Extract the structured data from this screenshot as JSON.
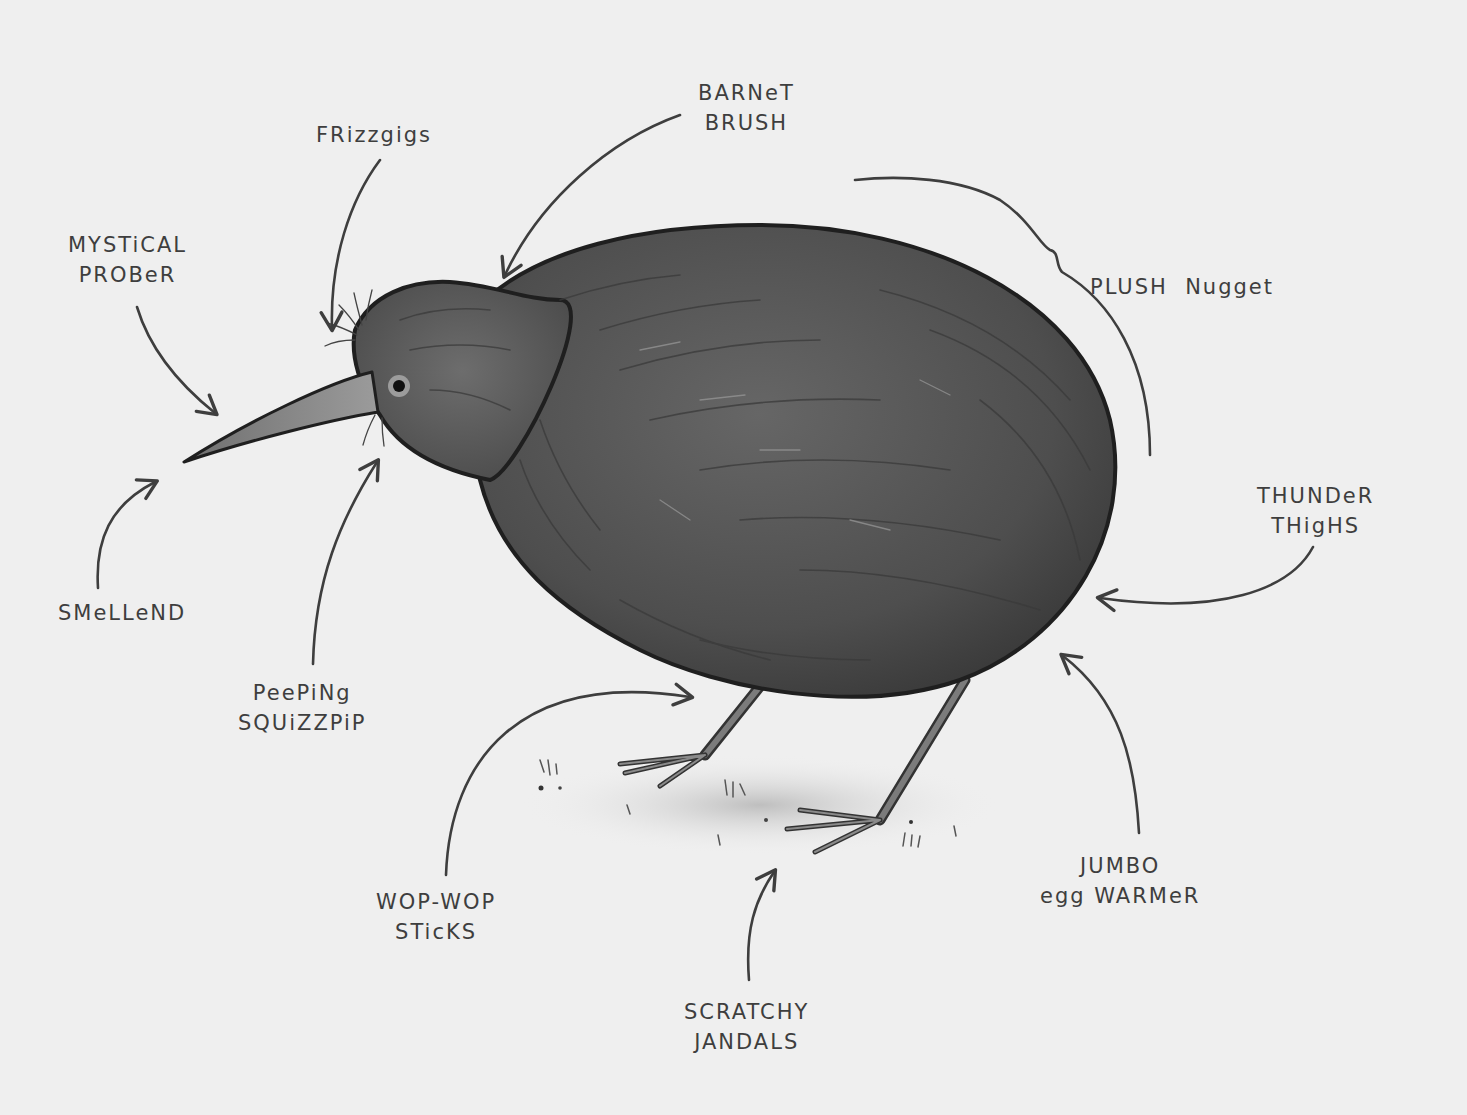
{
  "diagram": {
    "style": "hand-drawn grayscale illustration",
    "colors": {
      "background": "#efefef",
      "ink": "#3e3e3e",
      "body_dark": "#444444",
      "body_mid": "#5c5c5c",
      "beak": "#8a8a8a",
      "legs": "#6e6e6e",
      "ground_shadow": "#c8c8c8"
    },
    "labels": [
      {
        "id": "mystical-prober",
        "lines": [
          "MYSTiCAL",
          "PROBeR"
        ],
        "points_to": "beak tip"
      },
      {
        "id": "frizzgigs",
        "lines": [
          "FRizzgigs"
        ],
        "points_to": "whiskers above beak"
      },
      {
        "id": "barnet-brush",
        "lines": [
          "BARNeT",
          "BRUSH"
        ],
        "points_to": "top of head"
      },
      {
        "id": "plush-nugget",
        "lines": [
          "PLUSH  Nugget"
        ],
        "points_to": "back of body (bracket)"
      },
      {
        "id": "thunder-thighs",
        "lines": [
          "THUNDeR",
          "THigHS"
        ],
        "points_to": "rear of body"
      },
      {
        "id": "jumbo-egg-warmer",
        "lines": [
          "JUMBO",
          "egg WARMeR"
        ],
        "points_to": "belly underside"
      },
      {
        "id": "scratchy-jandals",
        "lines": [
          "SCRATCHY",
          "JANDALS"
        ],
        "points_to": "feet"
      },
      {
        "id": "wop-wop-sticks",
        "lines": [
          "WOP-WOP",
          "STicKS"
        ],
        "points_to": "legs"
      },
      {
        "id": "peeping-squizzpip",
        "lines": [
          "PeePiNg",
          "SQUiZZPiP"
        ],
        "points_to": "eye / whiskers below"
      },
      {
        "id": "smellend",
        "lines": [
          "SMeLLeND"
        ],
        "points_to": "beak tip (nostrils)"
      }
    ]
  }
}
